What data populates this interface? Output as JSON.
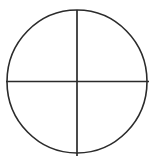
{
  "figure": {
    "background_color": "#ffffff",
    "canvas": {
      "width": 156,
      "height": 161
    }
  },
  "chart_data": {
    "type": "diagram",
    "shape": "circle-with-crosshair",
    "title": "",
    "xlabel": "",
    "ylabel": "",
    "grid": false,
    "legend": null,
    "annotations": [],
    "elements": [
      {
        "name": "circle-outline",
        "kind": "ellipse",
        "center_x": 77,
        "center_y": 81.5,
        "radius_x": 70,
        "radius_y": 71.5,
        "stroke_color": "#2b2b2b",
        "stroke_width": 1.6,
        "fill": "none"
      },
      {
        "name": "vertical-diameter",
        "kind": "line",
        "x1": 77,
        "y1": 10,
        "x2": 77,
        "y2": 156,
        "stroke_color": "#2b2b2b",
        "stroke_width": 1.7
      },
      {
        "name": "horizontal-diameter",
        "kind": "line",
        "x1": 6,
        "y1": 81.5,
        "x2": 149,
        "y2": 81.5,
        "stroke_color": "#2b2b2b",
        "stroke_width": 1.7
      }
    ],
    "quadrants": [
      {
        "name": "upper-left",
        "label": ""
      },
      {
        "name": "upper-right",
        "label": ""
      },
      {
        "name": "lower-left",
        "label": ""
      },
      {
        "name": "lower-right",
        "label": ""
      }
    ]
  }
}
